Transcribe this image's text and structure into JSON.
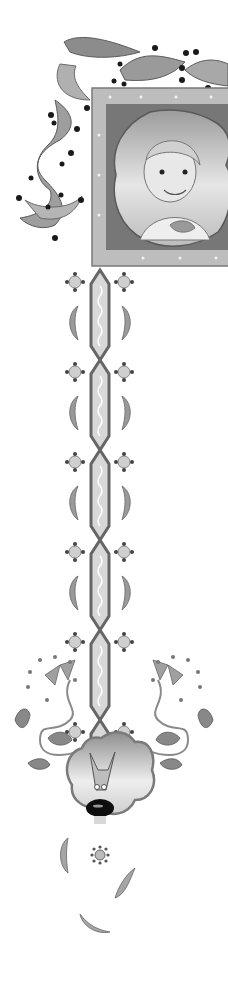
{
  "illustration": {
    "style": "illuminated-manuscript-border",
    "palette": {
      "background": "#ffffff",
      "frame": "#bdbdbd",
      "frame_dark": "#8a8a8a",
      "leaf": "#9a9a9a",
      "leaf_dark": "#6e6e6e",
      "dot": "#1a1a1a",
      "chain_fill": "#d8d8d8",
      "chain_stroke": "#666666",
      "portrait_bg": "#7a7a7a",
      "medallion_bg": "#cfcfcf"
    },
    "portrait": {
      "subject": "child-with-cap"
    },
    "medallion": {
      "subject": "dog-face"
    },
    "chain_segments": 6,
    "rosette_pairs": 6,
    "feather_pairs": 4
  }
}
